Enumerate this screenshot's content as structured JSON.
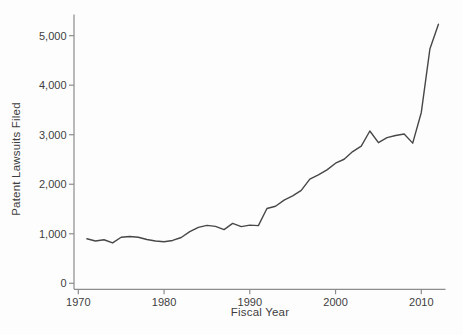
{
  "chart_data": {
    "type": "line",
    "title": "",
    "xlabel": "Fiscal Year",
    "ylabel": "Patent Lawsuits Filed",
    "x": [
      1971,
      1972,
      1973,
      1974,
      1975,
      1976,
      1977,
      1978,
      1979,
      1980,
      1981,
      1982,
      1983,
      1984,
      1985,
      1986,
      1987,
      1988,
      1989,
      1990,
      1991,
      1992,
      1993,
      1994,
      1995,
      1996,
      1997,
      1998,
      1999,
      2000,
      2001,
      2002,
      2003,
      2004,
      2005,
      2006,
      2007,
      2008,
      2009,
      2010,
      2011,
      2012
    ],
    "series": [
      {
        "name": "Patent lawsuits filed",
        "values": [
          900,
          855,
          880,
          815,
          930,
          945,
          930,
          885,
          855,
          840,
          865,
          925,
          1045,
          1130,
          1170,
          1150,
          1085,
          1210,
          1145,
          1175,
          1165,
          1510,
          1555,
          1680,
          1765,
          1875,
          2105,
          2190,
          2290,
          2425,
          2505,
          2660,
          2770,
          3075,
          2840,
          2940,
          2985,
          3015,
          2830,
          3450,
          4730,
          5230
        ]
      }
    ],
    "xticks": [
      1970,
      1980,
      1990,
      2000,
      2010
    ],
    "yticks": [
      0,
      1000,
      2000,
      3000,
      4000,
      5000
    ],
    "xlim": [
      1969.5,
      2012.9
    ],
    "ylim": [
      0,
      5420
    ],
    "grid": false,
    "legend_position": "none",
    "line_color": "#474747",
    "axis_color": "#8c8c8c",
    "text_color": "#3d3d3d",
    "background_color": "#fdfdfd"
  }
}
